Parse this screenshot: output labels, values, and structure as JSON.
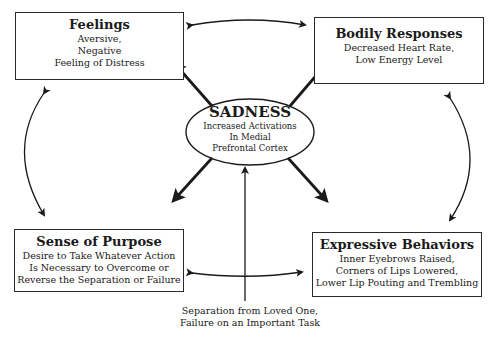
{
  "diagram": {
    "center": {
      "title": "SADNESS",
      "lines": [
        "Increased Activations",
        "In Medial",
        "Prefrontal Cortex"
      ]
    },
    "boxes": {
      "feelings": {
        "title": "Feelings",
        "lines": [
          "Aversive,",
          "Negative",
          "Feeling of Distress"
        ]
      },
      "bodily": {
        "title": "Bodily Responses",
        "lines": [
          "Decreased Heart Rate,",
          "Low Energy Level"
        ]
      },
      "purpose": {
        "title": "Sense of Purpose",
        "lines": [
          "Desire to Take Whatever Action",
          "Is Necessary to Overcome or",
          "Reverse the Separation or Failure"
        ]
      },
      "expressive": {
        "title": "Expressive Behaviors",
        "lines": [
          "Inner Eyebrows Raised,",
          "Corners of Lips Lowered,",
          "Lower Lip Pouting and Trembling"
        ]
      }
    },
    "cause": {
      "lines": [
        "Separation from Loved One,",
        "Failure on an Important Task"
      ]
    },
    "colors": {
      "line": "#1a1a1a",
      "background": "#ffffff"
    }
  }
}
